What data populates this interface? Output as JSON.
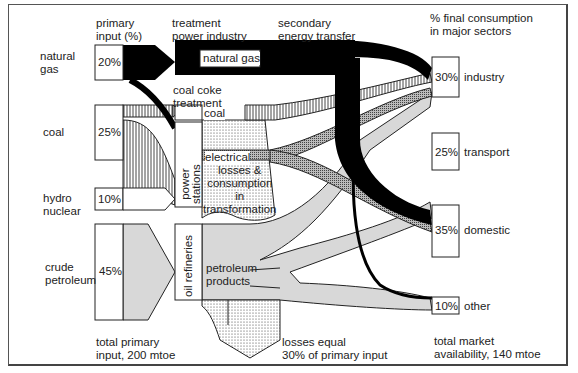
{
  "headers": {
    "primary_input": "primary\ninput (%)",
    "treatment": "treatment\npower industry",
    "secondary": "secondary\nenergy transfer",
    "final": "% final consumption\nin major sectors"
  },
  "sources": [
    {
      "name": "natural\ngas",
      "pct": "20%"
    },
    {
      "name": "coal",
      "pct": "25%"
    },
    {
      "name": "hydro\nnuclear",
      "pct": "10%"
    },
    {
      "name": "crude\npetroleum",
      "pct": "45%"
    }
  ],
  "processes": {
    "natural_gas": "natural gas",
    "coal_coke": "coal coke\ntreatment",
    "coal": "coal",
    "power_stations": "power\nstations",
    "electrical": "electrical",
    "losses": "losses &\nconsumption\nin\ntransformation",
    "oil_refineries": "oil refineries",
    "petroleum_products": "petroleum\nproducts"
  },
  "sectors": [
    {
      "name": "industry",
      "pct": "30%"
    },
    {
      "name": "transport",
      "pct": "25%"
    },
    {
      "name": "domestic",
      "pct": "35%"
    },
    {
      "name": "other",
      "pct": "10%"
    }
  ],
  "footer": {
    "total_primary": "total primary\ninput, 200 mtoe",
    "losses": "losses equal\n30% of primary input",
    "total_market": "total market\navailability, 140 mtoe"
  }
}
